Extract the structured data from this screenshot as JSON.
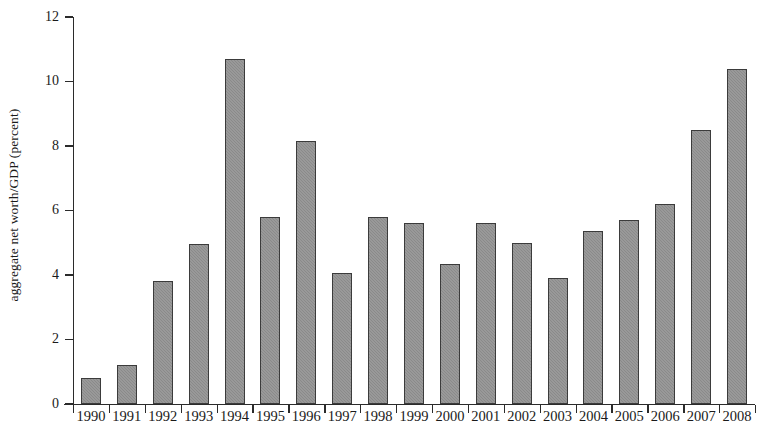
{
  "chart_data": {
    "type": "bar",
    "title": "",
    "xlabel": "",
    "ylabel": "aggregate net worth/GDP (percent)",
    "ylim": [
      0,
      12
    ],
    "ytick_labels": [
      "0",
      "2",
      "4",
      "6",
      "8",
      "10",
      "12"
    ],
    "yticks": [
      0,
      2,
      4,
      6,
      8,
      10,
      12
    ],
    "grid": false,
    "legend": null,
    "bar_color": "#8a8a8a",
    "bar_edge_color": "#3b3b3b",
    "background_color": "#ffffff",
    "categories": [
      "1990",
      "1991",
      "1992",
      "1993",
      "1994",
      "1995",
      "1996",
      "1997",
      "1998",
      "1999",
      "2000",
      "2001",
      "2002",
      "2003",
      "2004",
      "2005",
      "2006",
      "2007",
      "2008"
    ],
    "values": [
      0.8,
      1.2,
      3.8,
      4.95,
      10.7,
      5.8,
      8.15,
      4.05,
      5.8,
      5.6,
      4.35,
      5.6,
      5.0,
      3.9,
      5.35,
      5.7,
      6.2,
      8.5,
      10.4
    ]
  }
}
